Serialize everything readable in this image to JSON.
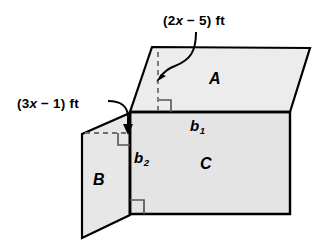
{
  "figure": {
    "background_color": "#ffffff",
    "fill_color": "#e9e9e9",
    "stroke_color": "#000000",
    "labels": {
      "top_dimension": "(2x − 5) ft",
      "left_dimension": "(3x − 1) ft",
      "region_a": "A",
      "region_b": "B",
      "region_c": "C",
      "base_1": "b",
      "base_1_sub": "1",
      "base_2": "b",
      "base_2_sub": "2"
    },
    "shapes": [
      {
        "name": "parallelogram-a",
        "label": "A",
        "points": "152,47 310,48 290,112 130,112"
      },
      {
        "name": "parallelogram-b",
        "label": "B",
        "points": "82,134 130,113 130,215 82,238"
      },
      {
        "name": "rectangle-c",
        "label": "C",
        "points": "130,112 290,112 290,214 130,214"
      }
    ],
    "annotations": [
      {
        "name": "altitude-a-dashed",
        "type": "dashed-line",
        "from": "158,52",
        "to": "158,112",
        "measures": "(2x − 5) ft"
      },
      {
        "name": "altitude-b-dashed",
        "type": "dashed-line",
        "from": "85,133",
        "to": "130,133",
        "measures": "(3x − 1) ft"
      },
      {
        "name": "right-angle-a",
        "type": "right-angle-marker",
        "at": "158,112"
      },
      {
        "name": "right-angle-b",
        "type": "right-angle-marker",
        "at": "130,133"
      },
      {
        "name": "right-angle-c",
        "type": "right-angle-marker",
        "at": "130,214"
      },
      {
        "name": "leader-arrow-top",
        "type": "curved-arrow",
        "points_to": "158,78"
      },
      {
        "name": "leader-arrow-left",
        "type": "curved-arrow",
        "points_to": "128,131"
      }
    ]
  }
}
